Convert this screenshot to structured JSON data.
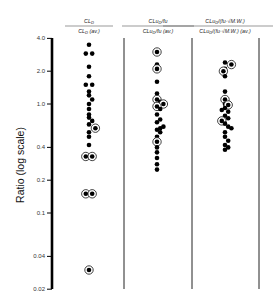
{
  "chart_data": {
    "type": "scatter",
    "title": "",
    "ylabel": "Ratio (log scale)",
    "xlabel": "",
    "yscale": "log",
    "ylim": [
      0.02,
      4.0
    ],
    "yticks": [
      {
        "value": 4.0,
        "label": "4.0"
      },
      {
        "value": 2.0,
        "label": "2.0"
      },
      {
        "value": 1.0,
        "label": "1.0"
      },
      {
        "value": 0.4,
        "label": "0.4"
      },
      {
        "value": 0.2,
        "label": "0.2"
      },
      {
        "value": 0.1,
        "label": "0.1"
      },
      {
        "value": 0.04,
        "label": "0.04"
      },
      {
        "value": 0.02,
        "label": "0.02"
      }
    ],
    "grid": false,
    "legend": "none",
    "marker_note": "Filled dots = compounds; circled dots = highlighted compounds",
    "series": [
      {
        "name": "CL_D / CL_D (av.)",
        "header_numerator": "CL",
        "header_numerator_sub": "D",
        "header_denominator": "CL",
        "header_denominator_sub": "D",
        "header_denominator_suffix": " (av.)",
        "points": [
          {
            "value": 3.5,
            "circled": false,
            "offset": 0
          },
          {
            "value": 2.9,
            "circled": false,
            "offset": -1
          },
          {
            "value": 2.9,
            "circled": false,
            "offset": 1
          },
          {
            "value": 2.2,
            "circled": false,
            "offset": 0
          },
          {
            "value": 1.8,
            "circled": false,
            "offset": 0
          },
          {
            "value": 1.5,
            "circled": false,
            "offset": -1
          },
          {
            "value": 1.5,
            "circled": false,
            "offset": 1
          },
          {
            "value": 1.3,
            "circled": false,
            "offset": 0
          },
          {
            "value": 1.2,
            "circled": false,
            "offset": 0
          },
          {
            "value": 1.1,
            "circled": false,
            "offset": 1
          },
          {
            "value": 1.0,
            "circled": false,
            "offset": 0
          },
          {
            "value": 0.9,
            "circled": false,
            "offset": 0
          },
          {
            "value": 0.8,
            "circled": false,
            "offset": 0
          },
          {
            "value": 0.75,
            "circled": false,
            "offset": 0
          },
          {
            "value": 0.7,
            "circled": false,
            "offset": 1
          },
          {
            "value": 0.65,
            "circled": false,
            "offset": 0
          },
          {
            "value": 0.6,
            "circled": true,
            "offset": 2
          },
          {
            "value": 0.55,
            "circled": false,
            "offset": 0
          },
          {
            "value": 0.5,
            "circled": false,
            "offset": 0
          },
          {
            "value": 0.42,
            "circled": false,
            "offset": 0
          },
          {
            "value": 0.33,
            "circled": true,
            "offset": -1
          },
          {
            "value": 0.33,
            "circled": true,
            "offset": 1
          },
          {
            "value": 0.15,
            "circled": true,
            "offset": -1
          },
          {
            "value": 0.15,
            "circled": true,
            "offset": 1
          },
          {
            "value": 0.03,
            "circled": true,
            "offset": 0
          }
        ]
      },
      {
        "name": "CLu_D/fu / CLu_D/fu (av.)",
        "header_numerator": "CLu",
        "header_numerator_sub": "D",
        "header_numerator_suffix": "/fu",
        "header_denominator": "CLu",
        "header_denominator_sub": "D",
        "header_denominator_suffix": "/fu (av.)",
        "points": [
          {
            "value": 3.0,
            "circled": true,
            "offset": 0
          },
          {
            "value": 2.3,
            "circled": false,
            "offset": 0
          },
          {
            "value": 2.1,
            "circled": true,
            "offset": 0
          },
          {
            "value": 1.6,
            "circled": false,
            "offset": 0
          },
          {
            "value": 1.25,
            "circled": false,
            "offset": 0
          },
          {
            "value": 1.1,
            "circled": true,
            "offset": 0
          },
          {
            "value": 1.05,
            "circled": false,
            "offset": 1
          },
          {
            "value": 1.0,
            "circled": true,
            "offset": 2
          },
          {
            "value": 0.95,
            "circled": true,
            "offset": 0
          },
          {
            "value": 0.9,
            "circled": false,
            "offset": 1
          },
          {
            "value": 0.8,
            "circled": false,
            "offset": 0
          },
          {
            "value": 0.72,
            "circled": false,
            "offset": 1
          },
          {
            "value": 0.68,
            "circled": false,
            "offset": 0
          },
          {
            "value": 0.62,
            "circled": false,
            "offset": 2
          },
          {
            "value": 0.6,
            "circled": false,
            "offset": 1
          },
          {
            "value": 0.58,
            "circled": false,
            "offset": 0
          },
          {
            "value": 0.55,
            "circled": false,
            "offset": 1
          },
          {
            "value": 0.5,
            "circled": false,
            "offset": 0
          },
          {
            "value": 0.45,
            "circled": true,
            "offset": 0
          },
          {
            "value": 0.4,
            "circled": false,
            "offset": 0
          },
          {
            "value": 0.36,
            "circled": false,
            "offset": 0
          },
          {
            "value": 0.32,
            "circled": false,
            "offset": 0
          },
          {
            "value": 0.28,
            "circled": false,
            "offset": 0
          },
          {
            "value": 0.25,
            "circled": false,
            "offset": 0
          }
        ]
      },
      {
        "name": "CLu_D/(fu·√M.W.) / CLu_D/(fu·√M.W.) (av.)",
        "header_numerator": "CLu",
        "header_numerator_sub": "D",
        "header_numerator_suffix": "/(fu·√M.W.)",
        "header_denominator": "CLu",
        "header_denominator_sub": "D",
        "header_denominator_suffix": "/(fu·√M.W.) (av.)",
        "points": [
          {
            "value": 2.4,
            "circled": false,
            "offset": 0
          },
          {
            "value": 2.3,
            "circled": true,
            "offset": 2
          },
          {
            "value": 2.1,
            "circled": false,
            "offset": 0
          },
          {
            "value": 2.0,
            "circled": true,
            "offset": -0.5
          },
          {
            "value": 1.8,
            "circled": false,
            "offset": 0
          },
          {
            "value": 1.3,
            "circled": false,
            "offset": 0
          },
          {
            "value": 1.1,
            "circled": true,
            "offset": 0
          },
          {
            "value": 1.0,
            "circled": false,
            "offset": 0
          },
          {
            "value": 0.98,
            "circled": true,
            "offset": 1
          },
          {
            "value": 0.92,
            "circled": false,
            "offset": 0
          },
          {
            "value": 0.88,
            "circled": false,
            "offset": -1
          },
          {
            "value": 0.85,
            "circled": false,
            "offset": 1
          },
          {
            "value": 0.78,
            "circled": false,
            "offset": 0
          },
          {
            "value": 0.74,
            "circled": false,
            "offset": 1
          },
          {
            "value": 0.7,
            "circled": true,
            "offset": -1
          },
          {
            "value": 0.66,
            "circled": false,
            "offset": 0
          },
          {
            "value": 0.62,
            "circled": false,
            "offset": 1
          },
          {
            "value": 0.6,
            "circled": false,
            "offset": 2
          },
          {
            "value": 0.55,
            "circled": false,
            "offset": 0
          },
          {
            "value": 0.5,
            "circled": false,
            "offset": 0
          },
          {
            "value": 0.46,
            "circled": false,
            "offset": 1
          },
          {
            "value": 0.42,
            "circled": false,
            "offset": 0
          },
          {
            "value": 0.4,
            "circled": false,
            "offset": 1
          },
          {
            "value": 0.38,
            "circled": false,
            "offset": 0
          }
        ]
      }
    ]
  }
}
